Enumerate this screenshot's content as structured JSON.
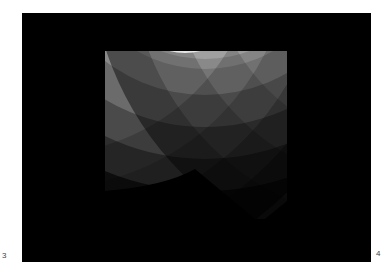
{
  "figure": {
    "background_color": "#000000",
    "band_family_a": {
      "center": [
        190,
        -40
      ],
      "radii": [
        55,
        95,
        135,
        175,
        215,
        255
      ],
      "grays": [
        "#f2f2f2",
        "#bdbdbd",
        "#9a9a9a",
        "#7a7a7a",
        "#555555",
        "#303030"
      ]
    },
    "band_family_b": {
      "center": [
        -30,
        -150
      ],
      "radii": [
        200,
        245,
        290,
        335,
        380
      ],
      "opacity_levels": [
        0.0,
        0.15,
        0.3,
        0.45,
        0.6
      ]
    }
  },
  "page_numbers": {
    "left": "3",
    "right": "4"
  }
}
